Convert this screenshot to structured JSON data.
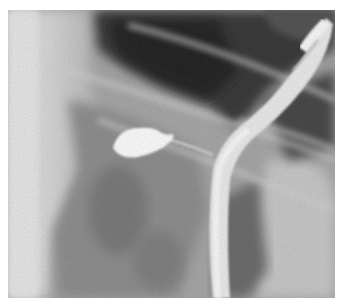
{
  "image": {
    "kind": "grayscale radiograph",
    "colors": {
      "background": "#ffffff",
      "soft_tissue_light": "#d8d8d8",
      "mid_gray": "#9a9a9a",
      "dark_air": "#2e2e2e",
      "contrast_white": "#f4f4f4"
    }
  }
}
